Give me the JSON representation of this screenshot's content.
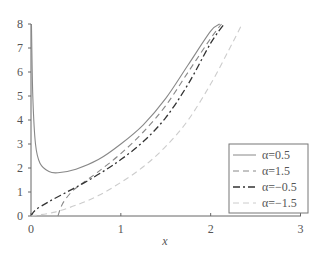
{
  "chart_data": {
    "type": "line",
    "title": "",
    "xlabel": "x",
    "ylabel": "",
    "xlim": [
      0,
      3
    ],
    "ylim": [
      0,
      8
    ],
    "xticks": [
      "0",
      "1",
      "2",
      "3"
    ],
    "yticks": [
      "0",
      "1",
      "2",
      "3",
      "4",
      "5",
      "6",
      "7",
      "8"
    ],
    "grid": false,
    "legend_position": "lower right",
    "series": [
      {
        "name": "α=0.5",
        "style": "solid",
        "color": "#888888",
        "x": [
          0.005,
          0.02,
          0.05,
          0.1,
          0.2,
          0.3,
          0.5,
          0.75,
          1.0,
          1.25,
          1.5,
          1.75,
          2.0,
          2.1
        ],
        "y": [
          8.0,
          5.0,
          3.0,
          2.2,
          1.85,
          1.8,
          1.95,
          2.35,
          3.0,
          3.8,
          4.9,
          6.3,
          7.7,
          8.0
        ]
      },
      {
        "name": "α=1.5",
        "style": "dashed",
        "color": "#888888",
        "x": [
          0.3,
          0.35,
          0.45,
          0.55,
          0.75,
          1.0,
          1.25,
          1.5,
          1.75,
          2.0,
          2.12
        ],
        "y": [
          0.0,
          0.5,
          1.0,
          1.3,
          1.85,
          2.6,
          3.5,
          4.6,
          6.0,
          7.4,
          8.0
        ]
      },
      {
        "name": "α=-0.5",
        "style": "dash-dot",
        "color": "#333333",
        "x": [
          0.0,
          0.05,
          0.2,
          0.4,
          0.6,
          0.8,
          1.0,
          1.25,
          1.5,
          1.75,
          2.0,
          2.15
        ],
        "y": [
          0.0,
          0.25,
          0.6,
          1.0,
          1.4,
          1.85,
          2.35,
          3.1,
          4.1,
          5.5,
          7.2,
          8.0
        ]
      },
      {
        "name": "α=-1.5",
        "style": "dashed",
        "color": "#cccccc",
        "x": [
          0.0,
          0.25,
          0.5,
          0.75,
          1.0,
          1.25,
          1.5,
          1.75,
          2.0,
          2.2,
          2.35
        ],
        "y": [
          0.0,
          0.15,
          0.45,
          0.85,
          1.4,
          2.05,
          2.9,
          4.0,
          5.5,
          6.9,
          8.0
        ]
      }
    ]
  },
  "legend": {
    "items": [
      "α=0.5",
      "α=1.5",
      "α=−0.5",
      "α=−1.5"
    ]
  },
  "axes": {
    "x_label": "x",
    "x_ticks": [
      "0",
      "1",
      "2",
      "3"
    ],
    "y_ticks": [
      "0",
      "1",
      "2",
      "3",
      "4",
      "5",
      "6",
      "7",
      "8"
    ]
  }
}
